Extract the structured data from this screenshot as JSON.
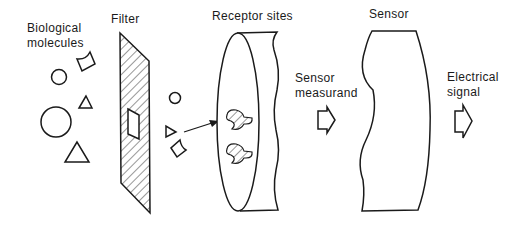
{
  "labels": {
    "biological_molecules_1": "Biological",
    "biological_molecules_2": "molecules",
    "filter": "Filter",
    "receptor_sites": "Receptor sites",
    "sensor_measurand_1": "Sensor",
    "sensor_measurand_2": "measurand",
    "sensor": "Sensor",
    "electrical_signal_1": "Electrical",
    "electrical_signal_2": "signal"
  },
  "colors": {
    "stroke": "#1a1a1a",
    "background": "#ffffff"
  }
}
